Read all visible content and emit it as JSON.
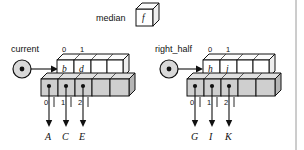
{
  "figure": {
    "title_label": "median",
    "median_cell_value": "f",
    "right_rule_present": true
  },
  "left_group": {
    "pointer_label": "current",
    "pointer_name": "current-pointer",
    "top_indices": [
      "0",
      "1"
    ],
    "top_cells": [
      {
        "value": "b",
        "filled": true
      },
      {
        "value": "d",
        "filled": true
      },
      {
        "value": "",
        "filled": false
      },
      {
        "value": "",
        "filled": false
      }
    ],
    "bottom_indices": [
      "0",
      "1",
      "2"
    ],
    "bottom_cells": [
      {
        "has_dot": true
      },
      {
        "has_dot": true
      },
      {
        "has_dot": true
      },
      {
        "has_dot": false
      },
      {
        "has_dot": false
      }
    ],
    "targets": [
      "A",
      "C",
      "E"
    ]
  },
  "right_group": {
    "pointer_label": "right_half",
    "pointer_name": "right-half-pointer",
    "top_indices": [
      "0",
      "1"
    ],
    "top_cells": [
      {
        "value": "h",
        "filled": true
      },
      {
        "value": "j",
        "filled": true
      },
      {
        "value": "",
        "filled": false
      },
      {
        "value": "",
        "filled": false
      }
    ],
    "bottom_indices": [
      "0",
      "1",
      "2"
    ],
    "bottom_cells": [
      {
        "has_dot": true
      },
      {
        "has_dot": true
      },
      {
        "has_dot": true
      },
      {
        "has_dot": false
      },
      {
        "has_dot": false
      }
    ],
    "targets": [
      "G",
      "I",
      "K"
    ]
  },
  "colors": {
    "line": "#111111",
    "gray_fill": "#cfcfcf",
    "gray_top": "#e0e0e0",
    "gray_side": "#b5b5b5",
    "white_fill": "#ffffff",
    "ring_fill": "#d9d9d9",
    "rule": "#9a9a9a"
  }
}
